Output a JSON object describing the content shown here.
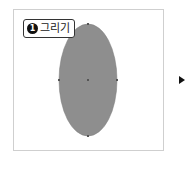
{
  "step": {
    "number": "1",
    "label": "그리기"
  },
  "shape": {
    "type": "ellipse",
    "fill": "#8e8e8e",
    "cx": 88,
    "cy": 80,
    "rx": 29,
    "ry": 56
  },
  "colors": {
    "frame_border": "#cfcfcf",
    "anchor": "#555555",
    "arrow": "#111111"
  }
}
